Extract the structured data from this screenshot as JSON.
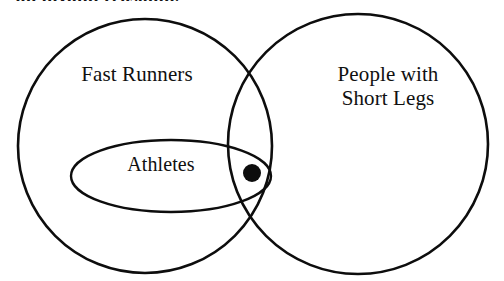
{
  "figure": {
    "kind": "venn-diagram",
    "width": 504,
    "height": 281,
    "background_color": "#ffffff",
    "stroke_color": "#0d0d0d",
    "cropped_heading_text": "an invalid reasoning"
  },
  "sets": {
    "left": {
      "label": "Fast Runners",
      "cx": 145,
      "cy": 146,
      "r": 127
    },
    "right": {
      "label_line1": "People with",
      "label_line2": "Short Legs",
      "cx": 358,
      "cy": 144,
      "r": 130
    },
    "subset": {
      "label": "Athletes",
      "cx": 171,
      "cy": 176,
      "rx": 100,
      "ry": 36
    }
  },
  "marker": {
    "name": "element-dot",
    "cx": 252,
    "cy": 173,
    "r": 9,
    "color": "#0d0d0d"
  }
}
